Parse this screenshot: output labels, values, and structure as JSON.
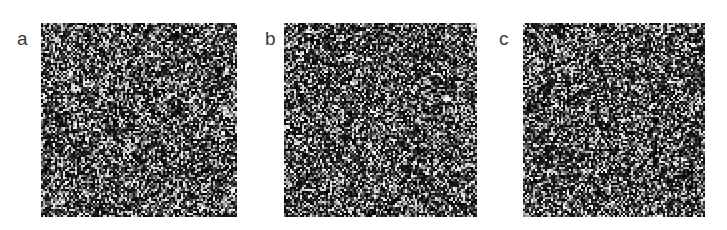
{
  "figure": {
    "background_color": "#ffffff",
    "width": 727,
    "height": 230,
    "caption": "",
    "label_color": "#3a3a3a",
    "panels": [
      {
        "label": "a",
        "label_x": 17,
        "label_y": 29,
        "x": 41,
        "y": 23,
        "width": 196,
        "height": 194,
        "image_kind": "grayscale-noise-micrograph",
        "mean_intensity": 0.34,
        "speckle_density": 0.3,
        "grain_size_px": 2,
        "seed": 11
      },
      {
        "label": "b",
        "label_x": 265,
        "label_y": 29,
        "x": 284,
        "y": 23,
        "width": 193,
        "height": 194,
        "image_kind": "grayscale-noise-micrograph",
        "mean_intensity": 0.33,
        "speckle_density": 0.29,
        "grain_size_px": 2,
        "seed": 27
      },
      {
        "label": "c",
        "label_x": 499,
        "label_y": 29,
        "x": 523,
        "y": 23,
        "width": 182,
        "height": 194,
        "image_kind": "grayscale-noise-micrograph",
        "mean_intensity": 0.32,
        "speckle_density": 0.28,
        "grain_size_px": 2,
        "seed": 43
      }
    ]
  },
  "chart_data": {
    "type": "heatmap",
    "title": "",
    "subtitle": "",
    "xlabel": "",
    "ylabel": "",
    "grid": false,
    "legend": "none",
    "panel_labels": [
      "a",
      "b",
      "c"
    ],
    "colormap": "grayscale",
    "value_range": [
      0,
      255
    ],
    "series": [
      {
        "name": "a",
        "mean_gray": 87,
        "bright_speckle_fraction": 0.3,
        "panel_size_px": [
          196,
          194
        ]
      },
      {
        "name": "b",
        "mean_gray": 84,
        "bright_speckle_fraction": 0.29,
        "panel_size_px": [
          193,
          194
        ]
      },
      {
        "name": "c",
        "mean_gray": 82,
        "bright_speckle_fraction": 0.28,
        "panel_size_px": [
          182,
          194
        ]
      }
    ]
  }
}
